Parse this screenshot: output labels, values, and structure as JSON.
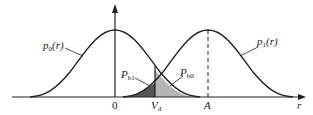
{
  "diagram": {
    "type": "probability density curves with decision threshold",
    "curves": [
      {
        "id": "p0",
        "label_main": "p",
        "label_sub": "0",
        "label_arg": "(r)",
        "center_label": "0"
      },
      {
        "id": "p1",
        "label_main": "p",
        "label_sub": "1",
        "label_arg": "(r)",
        "center_label": "A"
      }
    ],
    "regions": [
      {
        "id": "Pb1",
        "label_main": "P",
        "label_sub": "b1",
        "shade": "#555555"
      },
      {
        "id": "Pb0",
        "label_main": "P",
        "label_sub": "b0",
        "shade": "#b5b5b5"
      }
    ],
    "threshold": {
      "label_main": "V",
      "label_sub": "d"
    },
    "axis": {
      "x_label": "r",
      "origin_label": "0",
      "mean_label": "A"
    }
  }
}
